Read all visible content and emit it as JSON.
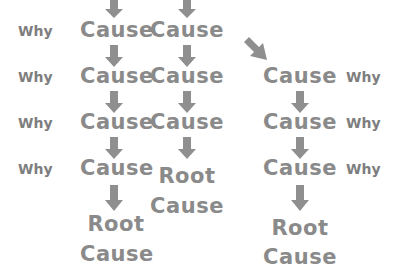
{
  "diagram": {
    "colors": {
      "text": "#8a8a8a",
      "arrow": "#8f8f8f"
    },
    "why_label": "Why",
    "cause_label": "Cause",
    "root_line1": "Root",
    "root_line2": "Cause",
    "left_whys": [
      "Why",
      "Why",
      "Why",
      "Why"
    ],
    "right_whys": [
      "Why",
      "Why",
      "Why"
    ],
    "column1": {
      "causes": [
        "Cause",
        "Cause",
        "Cause",
        "Cause"
      ],
      "root": [
        "Root",
        "Cause"
      ]
    },
    "column2": {
      "causes": [
        "Cause",
        "Cause",
        "Cause"
      ],
      "root": [
        "Root",
        "Cause"
      ]
    },
    "column3": {
      "causes": [
        "Cause",
        "Cause",
        "Cause"
      ],
      "root": [
        "Root",
        "Cause"
      ]
    }
  }
}
